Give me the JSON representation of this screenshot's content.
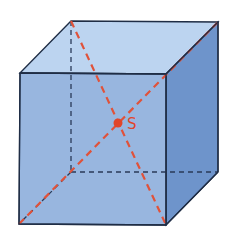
{
  "diagram": {
    "center_label": "S",
    "colors": {
      "top_face": "#bcd4f0",
      "front_face": "#8fb0dc",
      "right_face": "#6e94cb",
      "edge": "#1f2d45",
      "hidden_edge": "#2a3a58",
      "diagonal": "#e0523a",
      "center_point": "#e0452a"
    },
    "vertices": {
      "front_top_left": [
        20,
        73
      ],
      "front_top_right": [
        166,
        74
      ],
      "front_bottom_left": [
        19,
        224
      ],
      "front_bottom_right": [
        166,
        225
      ],
      "back_top_left": [
        71,
        21
      ],
      "back_top_right": [
        218,
        22
      ],
      "back_bottom_left": [
        71,
        172
      ],
      "back_bottom_right": [
        218,
        172
      ]
    },
    "center": [
      118,
      123
    ]
  }
}
